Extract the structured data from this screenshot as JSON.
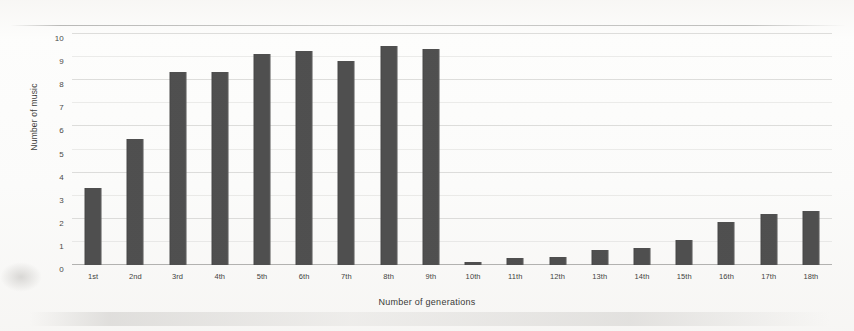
{
  "chart_data": {
    "type": "bar",
    "title": "",
    "xlabel": "Number of generations",
    "ylabel": "Number of music",
    "categories": [
      "1st",
      "2nd",
      "3rd",
      "4th",
      "5th",
      "6th",
      "7th",
      "8th",
      "9th",
      "10th",
      "11th",
      "12th",
      "13th",
      "14th",
      "15th",
      "16th",
      "17th",
      "18th"
    ],
    "values": [
      3.35,
      5.45,
      8.35,
      8.35,
      9.15,
      9.25,
      8.85,
      9.5,
      9.35,
      0.15,
      0.3,
      0.35,
      0.65,
      0.75,
      1.1,
      1.85,
      2.2,
      2.35
    ],
    "ytick_labels": [
      "0",
      "1",
      "2",
      "3",
      "4",
      "5",
      "6",
      "7",
      "8",
      "9",
      "10"
    ],
    "yticks": [
      0,
      1,
      2,
      3,
      4,
      5,
      6,
      7,
      8,
      9,
      10
    ],
    "ylim": [
      0,
      10
    ],
    "grid": true,
    "legend": "none",
    "bar_color": "#4c4c4c",
    "background_color": "#fcfcfb"
  }
}
